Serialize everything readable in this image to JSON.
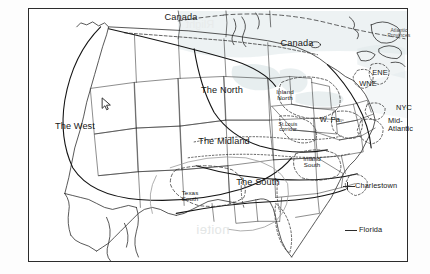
{
  "figure": {
    "type": "dialect-region-map",
    "frame_border_color": "#2b2b2b",
    "background_color": "#ffffff",
    "line_color": "#1f1f1f",
    "dashed_line_color": "#2b2b2b",
    "water_shading_color": "#d9e3e6"
  },
  "cursor": {
    "name": "mouse-pointer",
    "x": 101,
    "y": 97
  },
  "watermark": {
    "text_mirrored_1": "noitei",
    "text_mirrored_2": "Rlight"
  },
  "caption": {
    "text": "",
    "note": "bottom caption line is clipped at image edge and illegible"
  },
  "labels": [
    {
      "id": "canada-west",
      "name": "region-label-canada-west",
      "text": "Canada",
      "x": 181,
      "y": 13,
      "size": "big",
      "align": "center"
    },
    {
      "id": "canada-east",
      "name": "region-label-canada-east",
      "text": "Canada",
      "x": 297,
      "y": 39,
      "size": "big",
      "align": "center"
    },
    {
      "id": "atlantic-prov",
      "name": "region-label-atlantic-provinces",
      "text": "Atlantic\nProvinces",
      "x": 399,
      "y": 28,
      "size": "tiny",
      "align": "center"
    },
    {
      "id": "the-north",
      "name": "region-label-the-north",
      "text": "The North",
      "x": 222,
      "y": 86,
      "size": "big",
      "align": "center"
    },
    {
      "id": "inland-north",
      "name": "region-label-inland-north",
      "text": "Inland\nNorth",
      "x": 285,
      "y": 89,
      "size": "small",
      "align": "center"
    },
    {
      "id": "ene",
      "name": "region-label-ene",
      "text": "ENE",
      "x": 380,
      "y": 69,
      "size": "mid",
      "align": "center"
    },
    {
      "id": "wne",
      "name": "region-label-wne",
      "text": "WNE",
      "x": 368,
      "y": 80,
      "size": "mid",
      "align": "center"
    },
    {
      "id": "nyc",
      "name": "region-label-nyc",
      "text": "NYC",
      "x": 396,
      "y": 104,
      "size": "mid",
      "align": "left"
    },
    {
      "id": "mid-atlantic",
      "name": "region-label-mid-atlantic",
      "text": "Mid-\nAtlantic",
      "x": 388,
      "y": 117,
      "size": "mid",
      "align": "left"
    },
    {
      "id": "w-pa",
      "name": "region-label-w-pa",
      "text": "W. Pa.",
      "x": 331,
      "y": 116,
      "size": "mid",
      "align": "center"
    },
    {
      "id": "st-louis",
      "name": "region-label-st-louis-corridor",
      "text": "St.Louis\ncorridor",
      "x": 288,
      "y": 122,
      "size": "tiny",
      "align": "center"
    },
    {
      "id": "the-midland",
      "name": "region-label-the-midland",
      "text": "The Midland",
      "x": 224,
      "y": 137,
      "size": "big",
      "align": "center"
    },
    {
      "id": "the-west",
      "name": "region-label-the-west",
      "text": "The West",
      "x": 75,
      "y": 122,
      "size": "big",
      "align": "center"
    },
    {
      "id": "texas-south",
      "name": "region-label-texas-south",
      "text": "Texas\nSouth",
      "x": 190,
      "y": 190,
      "size": "small",
      "align": "center"
    },
    {
      "id": "the-south",
      "name": "region-label-the-south",
      "text": "The South",
      "x": 258,
      "y": 178,
      "size": "big",
      "align": "center"
    },
    {
      "id": "inland-south",
      "name": "region-label-inland-south",
      "text": "Inland\nSouth",
      "x": 312,
      "y": 156,
      "size": "small",
      "align": "center"
    },
    {
      "id": "charlestown",
      "name": "region-label-charlestown",
      "text": "Charlestown",
      "x": 355,
      "y": 182,
      "size": "mid",
      "align": "left"
    },
    {
      "id": "florida",
      "name": "region-label-florida",
      "text": "Florida",
      "x": 359,
      "y": 226,
      "size": "mid",
      "align": "left"
    }
  ],
  "leaders": [
    {
      "name": "leader-charlestown",
      "x": 342,
      "y": 185,
      "w": 12
    },
    {
      "name": "leader-florida",
      "x": 345,
      "y": 229,
      "w": 12
    }
  ]
}
